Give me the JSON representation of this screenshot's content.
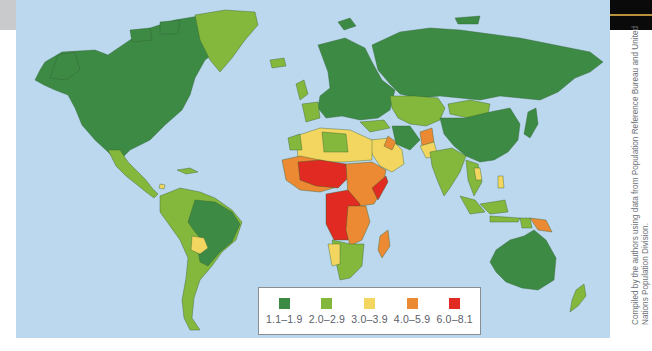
{
  "map": {
    "title": "World total fertility rate",
    "ocean_color": "#bcd8ee",
    "border_color": "#3b6e3a"
  },
  "legend": {
    "items": [
      {
        "label": "1.1–1.9",
        "color": "#3d8a45"
      },
      {
        "label": "2.0–2.9",
        "color": "#84b83c"
      },
      {
        "label": "3.0–3.9",
        "color": "#f3d660"
      },
      {
        "label": "4.0–5.9",
        "color": "#ec8a34"
      },
      {
        "label": "6.0–8.1",
        "color": "#e02a22"
      }
    ]
  },
  "credit": {
    "text": "Compiled by the authors using data from Population Reference Bureau and United Nations Population Division."
  }
}
